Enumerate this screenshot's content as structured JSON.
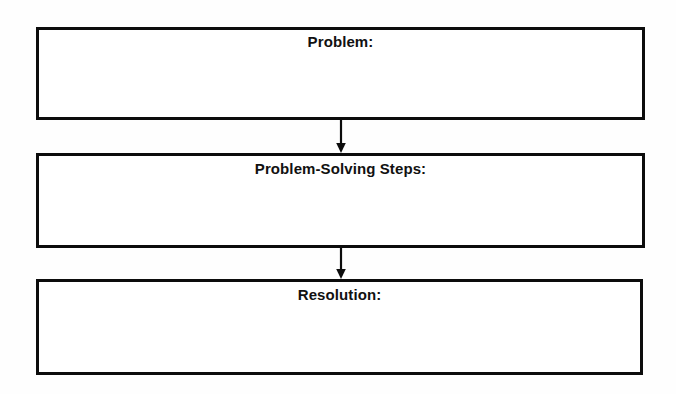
{
  "organizer": {
    "background_color": "#fefefe",
    "line_color": "#0c0c0c",
    "text_color": "#111111",
    "boxes": [
      {
        "id": "problem",
        "label": "Problem:",
        "content": ""
      },
      {
        "id": "steps",
        "label": "Problem-Solving Steps:",
        "content": ""
      },
      {
        "id": "resolution",
        "label": "Resolution:",
        "content": ""
      }
    ],
    "connectors": [
      {
        "id": "connector-1",
        "from": "problem",
        "to": "steps",
        "direction": "down",
        "arrowhead": "solid-triangle"
      },
      {
        "id": "connector-2",
        "from": "steps",
        "to": "resolution",
        "direction": "down",
        "arrowhead": "solid-triangle"
      }
    ]
  }
}
